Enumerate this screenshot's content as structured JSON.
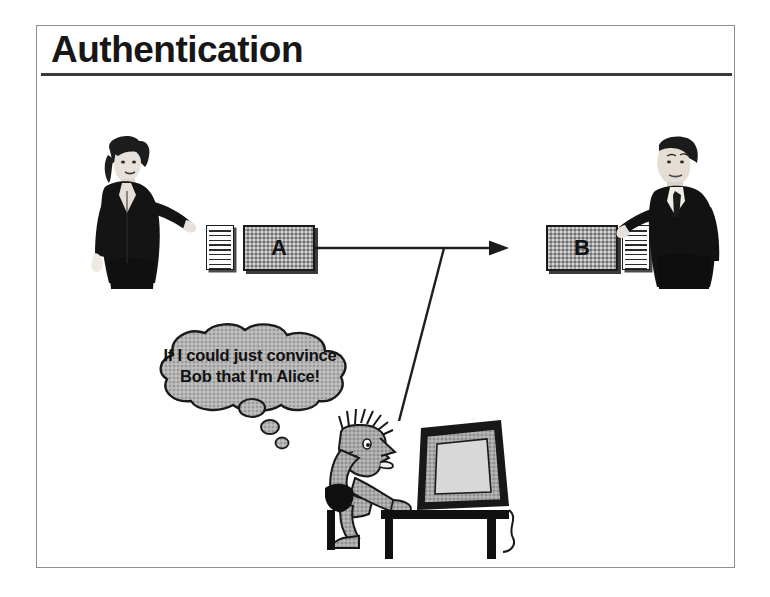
{
  "slide": {
    "title": "Authentication",
    "background_color": "#ffffff",
    "frame_color": "#8d8d8d",
    "rule_color": "#3a3a3a"
  },
  "diagram": {
    "type": "security-protocol-illustration",
    "nodes": [
      {
        "id": "a",
        "label": "A",
        "role": "sender-endpoint",
        "fill": "#a2a2a2",
        "stroke": "#1a1a1a"
      },
      {
        "id": "b",
        "label": "B",
        "role": "receiver-endpoint",
        "fill": "#a2a2a2",
        "stroke": "#1a1a1a"
      }
    ],
    "documents": [
      {
        "id": "doc-a",
        "name": "message-document-alice",
        "line_count": 9
      },
      {
        "id": "doc-b",
        "name": "message-document-bob",
        "line_count": 9
      }
    ],
    "connections": [
      {
        "from": "a",
        "to": "b",
        "style": "solid",
        "arrow": "end",
        "orientation": "horizontal"
      },
      {
        "from": "attacker-computer",
        "to": "channel-tap-point",
        "style": "solid",
        "arrow": "none",
        "orientation": "diagonal"
      }
    ],
    "actors": [
      {
        "id": "alice",
        "name": "alice-person",
        "description": "woman in dark suit handing over document",
        "side": "left"
      },
      {
        "id": "bob",
        "name": "bob-person",
        "description": "man in dark suit receiving document",
        "side": "right"
      },
      {
        "id": "trudy",
        "name": "attacker-person",
        "description": "spiky-haired hacker seated at desk with computer",
        "side": "center-bottom"
      }
    ]
  },
  "thought": {
    "name": "attacker-thought-bubble",
    "line1": "If I could just convince",
    "line2": "Bob that I'm Alice!",
    "bubble_fill": "#b0b0b0",
    "bubble_stroke": "#1a1a1a",
    "tail_bubble_count": 3
  },
  "icons": {
    "arrowhead": "arrow-right-icon",
    "document": "document-lines-icon",
    "monitor": "computer-monitor-icon",
    "desk": "desk-icon",
    "stool": "stool-icon"
  }
}
